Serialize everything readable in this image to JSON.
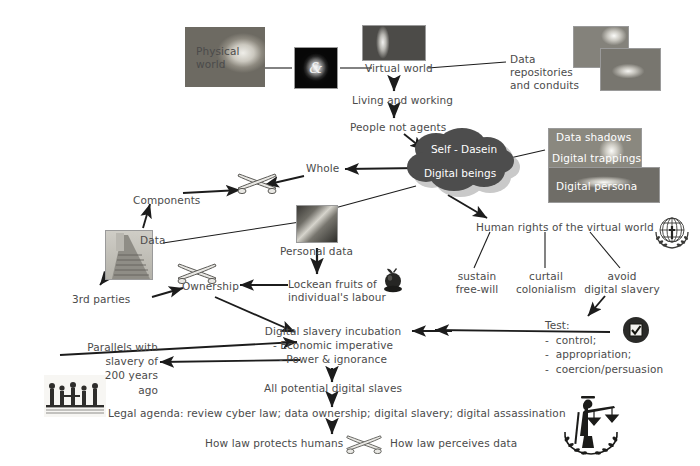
{
  "diagram": {
    "background_color": "#ffffff",
    "text_color": "#4b4b4b",
    "cloud_color": "#4d4d4d",
    "cloud_text_color": "#ffffff"
  },
  "nodes": {
    "physical_world": "Physical\nworld",
    "virtual_world": "Virtual world",
    "living_working": "Living and working",
    "people_not_agents": "People not agents",
    "data_repositories": "Data\nrepositories\nand conduits",
    "self_dasein": "Self - Dasein",
    "digital_beings": "Digital beings",
    "whole": "Whole",
    "components": "Components",
    "data": "Data",
    "personal_data": "Personal data",
    "third_parties": "3rd parties",
    "ownership": "Ownership",
    "lockean_fruits": "Lockean fruits of\nindividual's labour",
    "human_rights": "Human rights of the virtual world",
    "sustain_free_will": "sustain\nfree-will",
    "curtail_colonialism": "curtail\ncolonialism",
    "avoid_digital_slavery": "avoid\ndigital slavery",
    "test_block": "Test:\n-  control;\n-  appropriation;\n-  coercion/persuasion",
    "digital_slavery_incubation": "Digital slavery incubation\n- Economic imperative\n- Power & ignorance",
    "parallels_slavery": "Parallels with\nslavery of\n200 years\nago",
    "all_potential_slaves": "All potential digital slaves",
    "legal_agenda": "Legal agenda: review cyber law; data ownership; digital slavery; digital assassination",
    "how_law_protects": "How law protects humans",
    "how_law_perceives": "How law perceives data"
  },
  "images": {
    "physical_world_photo": "cracked-globe-photo",
    "ampersand_photo": "glowing-ampersand-photo",
    "virtual_world_photo": "abstract-light-photo",
    "data_repositories_photo_a": "data-conduit-photo",
    "data_repositories_photo_b": "data-repository-photo",
    "data_shadows_photo": "data-shadows-photo",
    "data_persona_photo": "digital-persona-photo",
    "personal_data_photo": "personal-data-photo",
    "data_pyramid_photo": "data-ziggurat-photo",
    "slavery_engraving_photo": "historical-slavery-engraving"
  },
  "image_captions": {
    "data_shadows": "Data shadows",
    "digital_trappings": "Digital trappings",
    "digital_persona": "Digital persona"
  },
  "icons": {
    "swords_whole": "crossed-swords-icon",
    "swords_ownership": "crossed-swords-icon",
    "swords_law": "crossed-swords-icon",
    "apple": "apple-icon",
    "who_emblem": "who-globe-laurel-emblem-icon",
    "checkbox": "checkbox-checked-icon",
    "justice_scales": "lady-justice-scales-icon"
  }
}
